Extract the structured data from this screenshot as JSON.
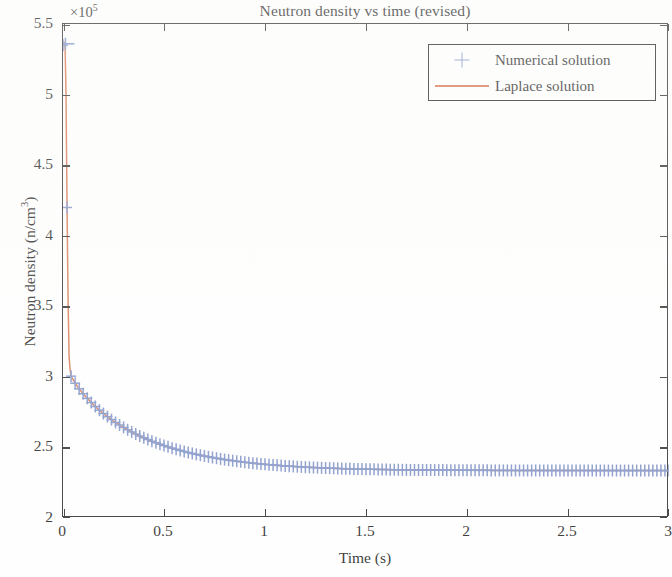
{
  "figure": {
    "title": "Neutron density vs time (revised)",
    "exponent_label": "×10",
    "exponent_power": "5",
    "xlabel": "Time (s)",
    "ylabel_main": "Neutron density (n/cm",
    "ylabel_sup": "3",
    "ylabel_tail": ")"
  },
  "legend": {
    "position": "top-right-inside",
    "entries": [
      {
        "label": "Numerical solution",
        "marker": "plus-icon",
        "color": "#7b8fc6"
      },
      {
        "label": "Laplace solution",
        "marker": "line",
        "color": "#d4724a"
      }
    ]
  },
  "axes": {
    "x_ticks": [
      "0",
      "0.5",
      "1",
      "1.5",
      "2",
      "2.5",
      "3"
    ],
    "y_ticks": [
      "2",
      "2.5",
      "3",
      "3.5",
      "4",
      "4.5",
      "5",
      "5.5"
    ]
  },
  "colors": {
    "numerical_marker": "#7b8fc6",
    "laplace_line": "#d4724a",
    "axis": "#262626",
    "background": "#ffffff"
  },
  "chart_data": {
    "type": "line",
    "title": "Neutron density vs time (revised)",
    "xlabel": "Time (s)",
    "ylabel": "Neutron density (n/cm^3)",
    "y_exponent": 100000.0,
    "y_exponent_label": "×10^5",
    "xlim": [
      0,
      3
    ],
    "ylim": [
      2,
      5.5
    ],
    "xticks": [
      0,
      0.5,
      1,
      1.5,
      2,
      2.5,
      3
    ],
    "yticks": [
      2,
      2.5,
      3,
      3.5,
      4,
      4.5,
      5,
      5.5
    ],
    "grid": false,
    "legend_position": "upper right",
    "annotations": [
      "Sharp prompt-jump spike near t = 0 reaching about 5.35e5 n/cm^3",
      "Near-vertical prompt drop to about 3.0e5 n/cm^3 by t = 0.04 s",
      "Slow delayed-neutron decay to an asymptote near 2.35e5 n/cm^3"
    ],
    "series": [
      {
        "name": "Numerical solution",
        "style": "markers",
        "marker": "+",
        "color": "#7b8fc6",
        "x": [
          0.0,
          0.01,
          0.02,
          0.03,
          0.04,
          0.05,
          0.06,
          0.08,
          0.1,
          0.12,
          0.14,
          0.16,
          0.18,
          0.2,
          0.23,
          0.26,
          0.29,
          0.32,
          0.35,
          0.38,
          0.41,
          0.44,
          0.47,
          0.5,
          0.54,
          0.58,
          0.62,
          0.66,
          0.7,
          0.75,
          0.8,
          0.85,
          0.9,
          0.95,
          1.0,
          1.1,
          1.2,
          1.3,
          1.4,
          1.5,
          1.6,
          1.7,
          1.8,
          1.9,
          2.0,
          2.1,
          2.2,
          2.3,
          2.4,
          2.5,
          2.6,
          2.7,
          2.8,
          2.9,
          3.0
        ],
        "y": [
          535000,
          537000,
          420000,
          315000,
          300500,
          298000,
          295500,
          291500,
          288000,
          284800,
          281800,
          279000,
          276400,
          274000,
          270700,
          267700,
          265000,
          262500,
          260200,
          258100,
          256200,
          254400,
          252800,
          251300,
          249500,
          247900,
          246400,
          245100,
          243900,
          242600,
          241400,
          240400,
          239500,
          238700,
          238000,
          236900,
          236000,
          235400,
          234900,
          234600,
          234300,
          234100,
          234000,
          233900,
          233800,
          233750,
          233700,
          233680,
          233660,
          233650,
          233640,
          233630,
          233625,
          233620,
          233615
        ]
      },
      {
        "name": "Laplace solution",
        "style": "line",
        "color": "#d4724a",
        "x": [
          0.0,
          0.005,
          0.01,
          0.015,
          0.02,
          0.025,
          0.03,
          0.035,
          0.04,
          0.05,
          0.06,
          0.08,
          0.1,
          0.12,
          0.14,
          0.16,
          0.18,
          0.2,
          0.23,
          0.26,
          0.29,
          0.32,
          0.35,
          0.38,
          0.41,
          0.44,
          0.47,
          0.5,
          0.54,
          0.58,
          0.62,
          0.66,
          0.7,
          0.75,
          0.8,
          0.85,
          0.9,
          0.95,
          1.0,
          1.1,
          1.2,
          1.3,
          1.4,
          1.5,
          1.6,
          1.7,
          1.8,
          1.9,
          2.0,
          2.1,
          2.2,
          2.3,
          2.4,
          2.5,
          2.6,
          2.7,
          2.8,
          2.9,
          3.0
        ],
        "y": [
          535000,
          536500,
          537000,
          500000,
          420000,
          355000,
          315000,
          305000,
          300500,
          298000,
          295500,
          291500,
          288000,
          284800,
          281800,
          279000,
          276400,
          274000,
          270700,
          267700,
          265000,
          262500,
          260200,
          258100,
          256200,
          254400,
          252800,
          251300,
          249500,
          247900,
          246400,
          245100,
          243900,
          242600,
          241400,
          240400,
          239500,
          238700,
          238000,
          236900,
          236000,
          235400,
          234900,
          234600,
          234300,
          234100,
          234000,
          233900,
          233800,
          233750,
          233700,
          233680,
          233660,
          233650,
          233640,
          233630,
          233625,
          233620,
          233615
        ]
      }
    ]
  }
}
